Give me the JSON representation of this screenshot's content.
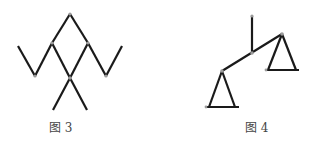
{
  "figures": [
    {
      "id": "fig3",
      "caption": "图 3",
      "description": "stick figure made of segments with joints"
    },
    {
      "id": "fig4",
      "caption": "图 4",
      "description": "balance scale with two triangular pans"
    }
  ],
  "colors": {
    "line": "#1a1a1a",
    "joint": "#9a9a9a",
    "caption": "#444444"
  }
}
